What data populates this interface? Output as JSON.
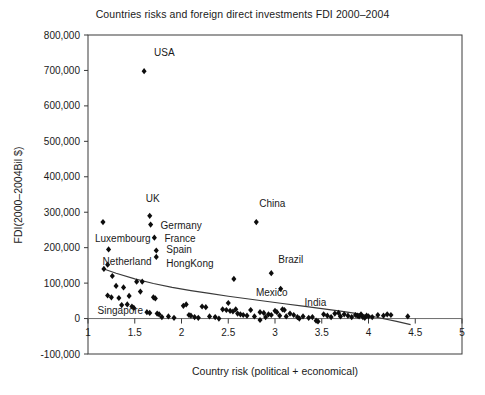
{
  "chart_data": {
    "type": "scatter",
    "title": "Countries risks and foreign direct investments FDI 2000–2004",
    "xlabel": "Country risk (political + economical)",
    "ylabel": "FDI(2000–2004Bil $)",
    "xlim": [
      1,
      5
    ],
    "ylim": [
      -100000,
      800000
    ],
    "xticks": [
      1,
      1.5,
      2,
      2.5,
      3,
      3.5,
      4,
      4.5,
      5
    ],
    "xtick_labels": [
      "1",
      "1.5",
      "2",
      "2.5",
      "3",
      "3.5",
      "4",
      "4.5",
      "5"
    ],
    "yticks": [
      -100000,
      0,
      100000,
      200000,
      300000,
      400000,
      500000,
      600000,
      700000,
      800000
    ],
    "ytick_labels": [
      "-100,000",
      "0",
      "100,000",
      "200,000",
      "300,000",
      "400,000",
      "500,000",
      "600,000",
      "700,000",
      "800,000"
    ],
    "grid": false,
    "legend": "none",
    "marker": "diamond",
    "marker_color": "#0d0d0d",
    "trendline": {
      "present": true,
      "style": "solid",
      "color": "#3a3a3a",
      "points": [
        [
          1.17,
          140000
        ],
        [
          1.3,
          128000
        ],
        [
          1.5,
          112000
        ],
        [
          1.7,
          99000
        ],
        [
          1.9,
          88000
        ],
        [
          2.1,
          79000
        ],
        [
          2.3,
          71000
        ],
        [
          2.5,
          63000
        ],
        [
          2.7,
          56000
        ],
        [
          2.9,
          49000
        ],
        [
          3.1,
          42000
        ],
        [
          3.3,
          35000
        ],
        [
          3.5,
          28000
        ],
        [
          3.7,
          21000
        ],
        [
          3.9,
          13000
        ],
        [
          4.1,
          3000
        ],
        [
          4.3,
          -8000
        ],
        [
          4.45,
          -17000
        ]
      ]
    },
    "annotations": [
      {
        "label": "USA",
        "x": 1.6,
        "y": 698000,
        "label_dx": 10,
        "label_dy": -15
      },
      {
        "label": "UK",
        "x": 1.66,
        "y": 290000,
        "label_dx": -4,
        "label_dy": -14
      },
      {
        "label": "Germany",
        "x": 1.67,
        "y": 265000,
        "label_dx": 10,
        "label_dy": 4
      },
      {
        "label": "France",
        "x": 1.71,
        "y": 228000,
        "label_dx": 10,
        "label_dy": 4
      },
      {
        "label": "Spain",
        "x": 1.73,
        "y": 190000,
        "label_dx": 10,
        "label_dy": 2
      },
      {
        "label": "HongKong",
        "x": 1.73,
        "y": 172000,
        "label_dx": 10,
        "label_dy": 9
      },
      {
        "label": "Luxembourg",
        "x": 1.16,
        "y": 272000,
        "label_dx": -8,
        "label_dy": 20
      },
      {
        "label": "Netherland",
        "x": 1.22,
        "y": 195000,
        "label_dx": -6,
        "label_dy": 16
      },
      {
        "label": "Singapore",
        "x": 1.21,
        "y": 65000,
        "label_dx": -10,
        "label_dy": 18
      },
      {
        "label": "China",
        "x": 2.8,
        "y": 272000,
        "label_dx": 3,
        "label_dy": -15
      },
      {
        "label": "Brazil",
        "x": 2.96,
        "y": 128000,
        "label_dx": 7,
        "label_dy": -10
      },
      {
        "label": "Mexico",
        "x": 2.56,
        "y": 112000,
        "label_dx": 22,
        "label_dy": 17
      },
      {
        "label": "India",
        "x": 3.06,
        "y": 84000,
        "label_dx": 24,
        "label_dy": 17
      }
    ],
    "points": [
      [
        1.6,
        698000
      ],
      [
        1.66,
        290000
      ],
      [
        1.67,
        265000
      ],
      [
        1.71,
        228000
      ],
      [
        1.73,
        192000
      ],
      [
        1.73,
        174000
      ],
      [
        1.16,
        272000
      ],
      [
        1.22,
        195000
      ],
      [
        2.8,
        272000
      ],
      [
        2.96,
        128000
      ],
      [
        2.56,
        112000
      ],
      [
        3.06,
        84000
      ],
      [
        1.17,
        140000
      ],
      [
        1.26,
        120000
      ],
      [
        1.21,
        152000
      ],
      [
        1.21,
        65000
      ],
      [
        1.25,
        60000
      ],
      [
        1.33,
        58000
      ],
      [
        1.36,
        38000
      ],
      [
        1.42,
        40000
      ],
      [
        1.44,
        64000
      ],
      [
        1.47,
        34000
      ],
      [
        1.49,
        30000
      ],
      [
        1.52,
        104000
      ],
      [
        1.58,
        104000
      ],
      [
        1.63,
        18000
      ],
      [
        1.66,
        16000
      ],
      [
        1.7,
        60000
      ],
      [
        1.72,
        57000
      ],
      [
        1.74,
        14000
      ],
      [
        1.76,
        12000
      ],
      [
        1.79,
        4000
      ],
      [
        1.86,
        6000
      ],
      [
        1.92,
        2000
      ],
      [
        2.02,
        36000
      ],
      [
        2.05,
        40000
      ],
      [
        2.08,
        10000
      ],
      [
        2.1,
        8000
      ],
      [
        2.14,
        4000
      ],
      [
        2.22,
        34000
      ],
      [
        2.26,
        32000
      ],
      [
        2.3,
        6000
      ],
      [
        2.36,
        4000
      ],
      [
        2.44,
        26000
      ],
      [
        2.48,
        24000
      ],
      [
        2.5,
        44000
      ],
      [
        2.52,
        22000
      ],
      [
        2.55,
        20000
      ],
      [
        2.58,
        26000
      ],
      [
        2.6,
        14000
      ],
      [
        2.63,
        12000
      ],
      [
        2.66,
        10000
      ],
      [
        2.7,
        8000
      ],
      [
        2.74,
        24000
      ],
      [
        2.78,
        6000
      ],
      [
        2.84,
        18000
      ],
      [
        2.88,
        16000
      ],
      [
        2.9,
        4000
      ],
      [
        2.93,
        12000
      ],
      [
        2.96,
        10000
      ],
      [
        3.0,
        22000
      ],
      [
        3.02,
        18000
      ],
      [
        3.05,
        8000
      ],
      [
        3.08,
        26000
      ],
      [
        3.1,
        24000
      ],
      [
        3.12,
        6000
      ],
      [
        3.16,
        14000
      ],
      [
        3.2,
        10000
      ],
      [
        3.24,
        4000
      ],
      [
        3.3,
        6000
      ],
      [
        3.36,
        2000
      ],
      [
        3.4,
        4000
      ],
      [
        3.44,
        -6000
      ],
      [
        3.46,
        -8000
      ],
      [
        3.52,
        12000
      ],
      [
        3.56,
        8000
      ],
      [
        3.6,
        4000
      ],
      [
        3.64,
        14000
      ],
      [
        3.68,
        16000
      ],
      [
        3.7,
        6000
      ],
      [
        3.74,
        12000
      ],
      [
        3.78,
        8000
      ],
      [
        3.82,
        4000
      ],
      [
        3.86,
        10000
      ],
      [
        3.88,
        8000
      ],
      [
        3.9,
        6000
      ],
      [
        3.92,
        12000
      ],
      [
        3.94,
        4000
      ],
      [
        3.96,
        2000
      ],
      [
        3.98,
        8000
      ],
      [
        4.0,
        6000
      ],
      [
        4.04,
        4000
      ],
      [
        4.1,
        10000
      ],
      [
        4.16,
        8000
      ],
      [
        4.2,
        12000
      ],
      [
        4.24,
        10000
      ],
      [
        4.42,
        6000
      ],
      [
        1.3,
        92000
      ],
      [
        1.38,
        88000
      ],
      [
        1.56,
        76000
      ],
      [
        2.18,
        2000
      ],
      [
        2.84,
        -4000
      ],
      [
        3.26,
        0
      ],
      [
        2.4,
        0
      ]
    ]
  }
}
